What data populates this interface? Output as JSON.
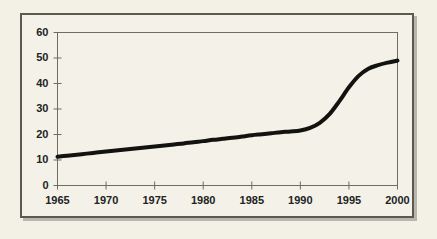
{
  "figure": {
    "background_color": "#f3f1e6",
    "frame_color": "#5a5a52",
    "plot_area_color": "#f4f2e8",
    "line_color": "#121210"
  },
  "chart_data": {
    "type": "line",
    "title": "",
    "subtitle": "",
    "xlabel": "",
    "ylabel": "",
    "xlim": [
      1965,
      2000
    ],
    "ylim": [
      0,
      60
    ],
    "grid": false,
    "legend": null,
    "xticks": [
      1965,
      1970,
      1975,
      1980,
      1985,
      1990,
      1995,
      2000
    ],
    "yticks": [
      0,
      10,
      20,
      30,
      40,
      50,
      60
    ],
    "xtick_labels": [
      "1965",
      "1970",
      "1975",
      "1980",
      "1985",
      "1990",
      "1995",
      "2000"
    ],
    "ytick_labels": [
      "0",
      "10",
      "20",
      "30",
      "40",
      "50",
      "60"
    ],
    "series": [
      {
        "name": "series-1",
        "color": "#121210",
        "linewidth": 4,
        "x": [
          1965,
          1966,
          1967,
          1968,
          1969,
          1970,
          1971,
          1972,
          1973,
          1974,
          1975,
          1976,
          1977,
          1978,
          1979,
          1980,
          1981,
          1982,
          1983,
          1984,
          1985,
          1986,
          1987,
          1988,
          1989,
          1990,
          1991,
          1992,
          1993,
          1994,
          1995,
          1996,
          1997,
          1998,
          1999,
          2000
        ],
        "values": [
          11.3,
          11.7,
          12.1,
          12.5,
          12.9,
          13.3,
          13.7,
          14.1,
          14.5,
          14.9,
          15.3,
          15.7,
          16.1,
          16.5,
          17.0,
          17.4,
          17.9,
          18.3,
          18.7,
          19.2,
          19.7,
          20.1,
          20.5,
          20.9,
          21.2,
          21.6,
          22.6,
          24.6,
          28.0,
          33.0,
          38.5,
          43.0,
          45.8,
          47.2,
          48.2,
          49.0
        ]
      }
    ]
  },
  "axis": {
    "y_labels": [
      "60",
      "50",
      "40",
      "30",
      "20",
      "10",
      "0"
    ],
    "x_labels": [
      "1965",
      "1970",
      "1975",
      "1980",
      "1985",
      "1990",
      "1995",
      "2000"
    ]
  }
}
